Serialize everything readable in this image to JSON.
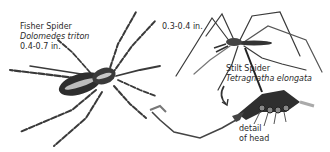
{
  "fisher_spider": {
    "common_name": "Fisher Spider",
    "scientific_name": "Dolomedes triton",
    "size": "0.4-0.7 in."
  },
  "stilt_spider": {
    "size": "0.3-0.4 in.",
    "common_name": "Stilt Spider",
    "scientific_name": "Tetragnatha elongata"
  },
  "detail": {
    "line1": "detail",
    "line2": "of head"
  },
  "colors": {
    "ink": "#2a2a2a",
    "background": "#ffffff"
  }
}
